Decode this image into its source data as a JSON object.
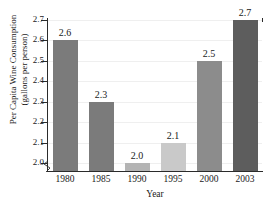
{
  "chart_data": {
    "type": "bar",
    "title": "",
    "xlabel": "Year",
    "ylabel": "Per Capita Wine Consumption\n(gallons per person)",
    "categories": [
      "1980",
      "1985",
      "1990",
      "1995",
      "2000",
      "2003"
    ],
    "values": [
      2.6,
      2.3,
      2.0,
      2.1,
      2.5,
      2.7
    ],
    "value_labels": [
      "2.6",
      "2.3",
      "2.0",
      "2.1",
      "2.5",
      "2.7"
    ],
    "bar_colors": [
      "#7b7b7b",
      "#7b7b7b",
      "#b4b4b4",
      "#c9c9c9",
      "#8c8c8c",
      "#5d5d5d"
    ],
    "ylim": [
      1.95,
      2.7
    ],
    "yticks": [
      2.0,
      2.1,
      2.2,
      2.3,
      2.4,
      2.5,
      2.6,
      2.7
    ],
    "ytick_labels": [
      "2.0",
      "2.1",
      "2.2",
      "2.3",
      "2.4",
      "2.5",
      "2.6",
      "2.7"
    ],
    "grid": true,
    "grid_color": "#efefef",
    "axis_color": "#2b2b2b",
    "axis_break": true,
    "legend": "none"
  }
}
